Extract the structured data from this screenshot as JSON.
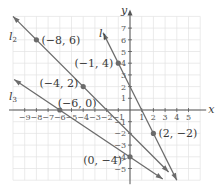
{
  "graph": {
    "origin_px": [
      130,
      110
    ],
    "unit_px": 11.7,
    "x_range": [
      -10,
      6
    ],
    "y_range": [
      -6,
      8
    ],
    "x_label": "x",
    "y_label": "y",
    "x_ticks": [
      -9,
      -8,
      -7,
      -6,
      -5,
      -4,
      -3,
      -2,
      -1,
      1,
      2,
      3,
      4,
      5
    ],
    "y_ticks": [
      -5,
      -4,
      -3,
      -2,
      -1,
      1,
      2,
      3,
      4,
      5,
      6,
      7
    ],
    "colors": {
      "line": "#6b6b6b",
      "point": "#6b6b6b",
      "grid": "#e3e3e3",
      "axis": "#555555"
    }
  },
  "lines": [
    {
      "name": "l1",
      "label": "l",
      "sub": "1",
      "points": [
        [
          -1,
          4
        ],
        [
          2,
          -2
        ]
      ]
    },
    {
      "name": "l2",
      "label": "l",
      "sub": "2",
      "points": [
        [
          -8,
          6
        ],
        [
          -4,
          2
        ]
      ]
    },
    {
      "name": "l3",
      "label": "l",
      "sub": "3",
      "points": [
        [
          -6,
          0
        ],
        [
          0,
          -4
        ]
      ]
    }
  ],
  "points": [
    {
      "coords": [
        -8,
        6
      ],
      "label": "(−8, 6)"
    },
    {
      "coords": [
        -1,
        4
      ],
      "label": "(−1, 4)"
    },
    {
      "coords": [
        -4,
        2
      ],
      "label": "(−4, 2)"
    },
    {
      "coords": [
        -6,
        0
      ],
      "label": "(−6, 0)"
    },
    {
      "coords": [
        2,
        -2
      ],
      "label": "(2, −2)"
    },
    {
      "coords": [
        0,
        -4
      ],
      "label": "(0, −4)"
    }
  ]
}
